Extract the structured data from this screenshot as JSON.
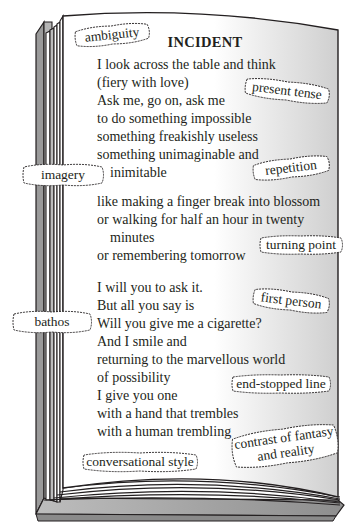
{
  "poem": {
    "title": "INCIDENT",
    "lines": [
      {
        "text": "I look across the table and think",
        "indent": false
      },
      {
        "text": "(fiery with love)",
        "indent": false
      },
      {
        "text": "Ask me, go on, ask me",
        "indent": false
      },
      {
        "text": "to do something impossible",
        "indent": false
      },
      {
        "text": "something freakishly useless",
        "indent": false
      },
      {
        "text": "something unimaginable and",
        "indent": false
      },
      {
        "text": "inimitable",
        "indent": true
      },
      {
        "text": "",
        "indent": false
      },
      {
        "text": "like making a finger break into blossom",
        "indent": false
      },
      {
        "text": "or walking for half an hour in twenty",
        "indent": false
      },
      {
        "text": "minutes",
        "indent": true
      },
      {
        "text": "or remembering tomorrow",
        "indent": false
      },
      {
        "text": "",
        "indent": false
      },
      {
        "text": "I will you to ask it.",
        "indent": false
      },
      {
        "text": "But all you say is",
        "indent": false
      },
      {
        "text": "Will you give me a cigarette?",
        "indent": false
      },
      {
        "text": "And I smile and",
        "indent": false
      },
      {
        "text": "returning to the marvellous world",
        "indent": false
      },
      {
        "text": "of possibility",
        "indent": false
      },
      {
        "text": "I give you one",
        "indent": false
      },
      {
        "text": "with a hand that trembles",
        "indent": false
      },
      {
        "text": "with a human trembling",
        "indent": false
      }
    ]
  },
  "annotations": [
    {
      "id": "ambiguity",
      "label": "ambiguity"
    },
    {
      "id": "present-tense",
      "label": "present tense"
    },
    {
      "id": "imagery",
      "label": "imagery"
    },
    {
      "id": "repetition",
      "label": "repetition"
    },
    {
      "id": "turning-point",
      "label": "turning point"
    },
    {
      "id": "first-person",
      "label": "first person"
    },
    {
      "id": "bathos",
      "label": "bathos"
    },
    {
      "id": "end-stopped-line",
      "label": "end-stopped line"
    },
    {
      "id": "contrast",
      "label_line1": "contrast of fantasy",
      "label_line2": "and reality"
    },
    {
      "id": "conversational-style",
      "label": "conversational style"
    }
  ],
  "colors": {
    "ink": "#231f20",
    "page": "#ffffff",
    "page_shadow": "#d9d9d9",
    "spine_grey": "#a8a8a8",
    "cover_grey": "#9a9a9a"
  }
}
